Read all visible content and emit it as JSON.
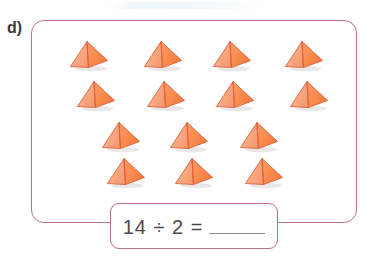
{
  "item": {
    "label": "d)"
  },
  "equation": {
    "dividend": "14",
    "divisor": "2",
    "operator": "÷",
    "equals": "=",
    "expression": "14 ÷ 2 =",
    "answer": ""
  },
  "manipulatives": {
    "object_name": "pyramid",
    "total_count": 14,
    "rows": [
      {
        "count": 4,
        "items": [
          {
            "x": 68,
            "y": 40
          },
          {
            "x": 142,
            "y": 40
          },
          {
            "x": 211,
            "y": 40
          },
          {
            "x": 283,
            "y": 40
          }
        ]
      },
      {
        "count": 4,
        "items": [
          {
            "x": 75,
            "y": 80
          },
          {
            "x": 145,
            "y": 80
          },
          {
            "x": 214,
            "y": 80
          },
          {
            "x": 288,
            "y": 80
          }
        ]
      },
      {
        "count": 3,
        "items": [
          {
            "x": 100,
            "y": 121
          },
          {
            "x": 168,
            "y": 121
          },
          {
            "x": 238,
            "y": 121
          }
        ]
      },
      {
        "count": 3,
        "items": [
          {
            "x": 105,
            "y": 157
          },
          {
            "x": 173,
            "y": 157
          },
          {
            "x": 243,
            "y": 157
          }
        ]
      }
    ]
  },
  "colors": {
    "panel_border": "#bb6f8c",
    "pyramid_left_face": "#f8a882",
    "pyramid_right_face": "#f98a4e",
    "pyramid_outline": "#e0603a",
    "label_text": "#3a3a3c",
    "equation_text": "#4a4a4c",
    "answer_rule": "#8d8d90",
    "page_background": "#ffffff"
  }
}
